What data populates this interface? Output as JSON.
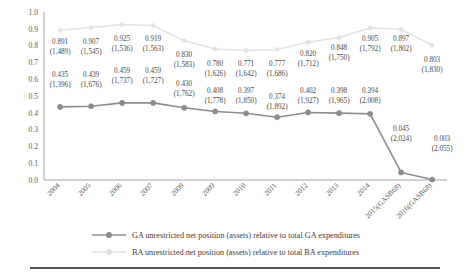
{
  "chart_data": {
    "type": "line",
    "title": "",
    "xlabel": "",
    "ylabel": "",
    "ylim": [
      0.0,
      1.0
    ],
    "ytick_labels": [
      "0.0",
      "0.1",
      "0.2",
      "0.3",
      "0.4",
      "0.5",
      "0.6",
      "0.7",
      "0.8",
      "0.9",
      "1.0"
    ],
    "ytick_values": [
      0.0,
      0.1,
      0.2,
      0.3,
      0.4,
      0.5,
      0.6,
      0.7,
      0.8,
      0.9,
      1.0
    ],
    "grid": false,
    "legend_position": "bottom",
    "categories": [
      "2004",
      "2005",
      "2006",
      "2007",
      "2008",
      "2009",
      "2010",
      "2011",
      "2012",
      "2013",
      "2014",
      "2015(GASB68)",
      "2016(GASB68)"
    ],
    "series": [
      {
        "name": "GA unrestricted net position (assets) relative to total GA expenditures",
        "short_name": "GA",
        "color": "#8c8c8c",
        "marker": "circle",
        "values": [
          0.435,
          0.439,
          0.459,
          0.459,
          0.43,
          0.408,
          0.397,
          0.374,
          0.402,
          0.398,
          0.394,
          0.045,
          0.003
        ],
        "value_labels": [
          "0.435",
          "0.439",
          "0.459",
          "0.459",
          "0.430",
          "0.408",
          "0.397",
          "0.374",
          "0.402",
          "0.398",
          "0.394",
          "0.045",
          "0.003"
        ],
        "secondary_labels": [
          "(1,396)",
          "(1,676)",
          "(1,737)",
          "(1,727)",
          "(1,762)",
          "(1,778)",
          "(1,850)",
          "(1,892)",
          "(1,927)",
          "(1,965)",
          "(2,008)",
          "(2,024)",
          "(2,055)"
        ]
      },
      {
        "name": "BA unrestricted net position (assets) relative to total BA expenditures",
        "short_name": "BA",
        "color": "#e2e2e2",
        "marker": "circle",
        "values": [
          0.891,
          0.907,
          0.925,
          0.919,
          0.83,
          0.78,
          0.771,
          0.777,
          0.82,
          0.848,
          0.905,
          0.897,
          0.803
        ],
        "value_labels": [
          "0.891",
          "0.907",
          "0.925",
          "0.919",
          "0.830",
          "0.780",
          "0.771",
          "0.777",
          "0.820",
          "0.848",
          "0.905",
          "0.897",
          "0.803"
        ],
        "secondary_labels": [
          "(1,489)",
          "(1,545)",
          "(1,536)",
          "(1,563)",
          "(1,583)",
          "(1,626)",
          "(1,642)",
          "(1,686)",
          "(1,712)",
          "(1,750)",
          "(1,792)",
          "(1,802)",
          "(1,830)"
        ]
      }
    ]
  },
  "legend": {
    "entries": [
      {
        "label": "GA unrestricted net position (assets) relative to total GA expenditures",
        "color": "#8c8c8c"
      },
      {
        "label": "BA unrestricted net position (assets) relative to total BA expenditures",
        "color": "#e2e2e2"
      }
    ]
  },
  "colors": {
    "ga_line": "#8c8c8c",
    "ba_line": "#e2e2e2",
    "axis": "#9a9a9a",
    "rule": "#1a1a1a",
    "text": "#3a3a3a"
  }
}
